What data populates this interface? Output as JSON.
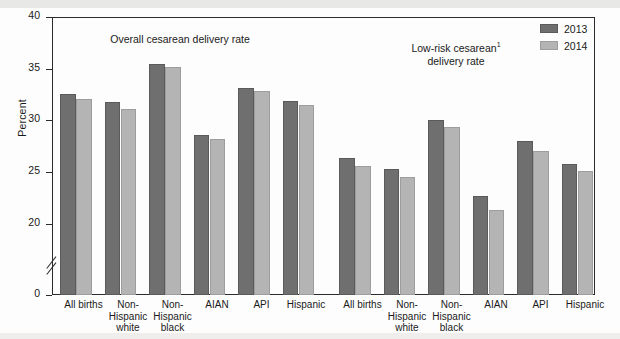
{
  "figure": {
    "y_axis_title": "Percent",
    "panels": [
      {
        "key": "overall",
        "title": "Overall cesarean delivery rate"
      },
      {
        "key": "lowrisk",
        "title_line1": "Low-risk cesarean",
        "title_footnote": "1",
        "title_line2": "delivery rate"
      }
    ]
  },
  "legend": {
    "position": "top-right",
    "items": [
      {
        "label": "2013",
        "color": "#6f6f6f"
      },
      {
        "label": "2014",
        "color": "#b4b4b4"
      }
    ]
  },
  "y_axis": {
    "label": "Percent",
    "ticks": [
      "0",
      "20",
      "25",
      "30",
      "35",
      "40"
    ],
    "tick_positions_px": [
      295,
      224,
      172,
      120,
      69,
      17
    ],
    "break_after": "0",
    "range_shown": [
      20,
      40
    ]
  },
  "x_axis": {
    "categories": [
      "All births",
      "Non-\nHispanic\nwhite",
      "Non-\nHispanic\nblack",
      "AIAN",
      "API",
      "Hispanic"
    ]
  },
  "chart_data": {
    "type": "bar",
    "title": "",
    "xlabel": "",
    "ylabel": "Percent",
    "ylim": [
      20,
      40
    ],
    "grid": false,
    "legend_position": "top-right",
    "axis_break": true,
    "panels": [
      {
        "name": "Overall cesarean delivery rate",
        "categories": [
          "All births",
          "Non-Hispanic white",
          "Non-Hispanic black",
          "AIAN",
          "API",
          "Hispanic"
        ],
        "series": [
          {
            "name": "2013",
            "color": "#6f6f6f",
            "values": [
              32.7,
              31.9,
              35.6,
              28.7,
              33.3,
              32.0
            ]
          },
          {
            "name": "2014",
            "color": "#b4b4b4",
            "values": [
              32.2,
              31.2,
              35.3,
              28.3,
              33.0,
              31.6
            ]
          }
        ]
      },
      {
        "name": "Low-risk cesarean delivery rate",
        "footnote_marker": "1",
        "categories": [
          "All births",
          "Non-Hispanic white",
          "Non-Hispanic black",
          "AIAN",
          "API",
          "Hispanic"
        ],
        "series": [
          {
            "name": "2013",
            "color": "#6f6f6f",
            "values": [
              26.5,
              25.4,
              30.2,
              22.8,
              28.1,
              25.9
            ]
          },
          {
            "name": "2014",
            "color": "#b4b4b4",
            "values": [
              25.7,
              24.6,
              29.5,
              21.4,
              27.1,
              25.2
            ]
          }
        ]
      }
    ]
  }
}
